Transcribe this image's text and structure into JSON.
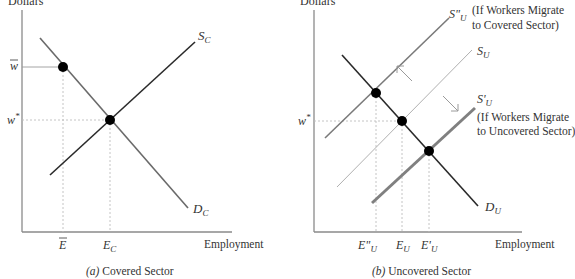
{
  "panel_a": {
    "y_axis_label": "Dollars",
    "x_axis_label": "Employment",
    "caption_prefix": "(a)",
    "caption_text": " Covered Sector",
    "supply_label": {
      "main": "S",
      "sub": "C"
    },
    "demand_label": {
      "main": "D",
      "sub": "C"
    },
    "wage_labels": {
      "w_bar": "w",
      "w_star": "w",
      "star": "*"
    },
    "employment_ticks": {
      "e_bar": "E",
      "e_c": {
        "main": "E",
        "sub": "C"
      }
    }
  },
  "panel_b": {
    "y_axis_label": "Dollars",
    "x_axis_label": "Employment",
    "caption_prefix": "(b)",
    "caption_text": " Uncovered Sector",
    "supply_double_prime": {
      "main": "S\"",
      "sub": "U"
    },
    "supply": {
      "main": "S",
      "sub": "U"
    },
    "supply_prime": {
      "main": "S'",
      "sub": "U"
    },
    "demand_label": {
      "main": "D",
      "sub": "U"
    },
    "note_covered": [
      "(If Workers Migrate",
      "to Covered Sector)"
    ],
    "note_uncovered": [
      "(If Workers Migrate",
      "to Uncovered Sector)"
    ],
    "wage_label": {
      "w": "w",
      "star": "*"
    },
    "employment_ticks": {
      "e_double_prime": {
        "main": "E\"",
        "sub": "U"
      },
      "e_u": {
        "main": "E",
        "sub": "U"
      },
      "e_prime": {
        "main": "E'",
        "sub": "U"
      }
    }
  },
  "colors": {
    "axis": "#8a8a8a",
    "supply_covered": "#2a2a2a",
    "demand_covered": "#6a6a6a",
    "demand_uncovered": "#2a2a2a",
    "supply_double_prime": "#7a7a7a",
    "supply_uncovered": "#b0b0b0",
    "supply_prime": "#808080",
    "guide": "#bdbdbd",
    "dot": "#000000",
    "arrow": "#9a9a9a"
  }
}
